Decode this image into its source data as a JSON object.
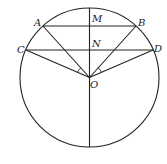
{
  "diagram": {
    "type": "geometry",
    "stroke_color": "#222222",
    "circle": {
      "center_label": "O"
    },
    "points": {
      "A": "A",
      "B": "B",
      "C": "C",
      "D": "D",
      "M": "M",
      "N": "N",
      "O": "O"
    },
    "segments": [
      "AB",
      "CD",
      "OA",
      "OB",
      "OC",
      "OD",
      "vertical diameter through M, N, O"
    ],
    "angle_marks": [
      "angle COA",
      "angle BOD"
    ]
  }
}
